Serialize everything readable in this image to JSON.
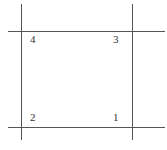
{
  "diagram": {
    "line_color": "#555555",
    "corners": [
      {
        "label": "4",
        "position": "top-left"
      },
      {
        "label": "3",
        "position": "top-right"
      },
      {
        "label": "2",
        "position": "bottom-left"
      },
      {
        "label": "1",
        "position": "bottom-right"
      }
    ]
  }
}
